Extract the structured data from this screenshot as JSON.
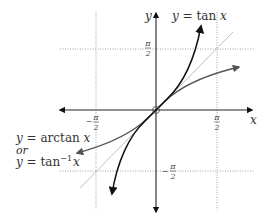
{
  "diagram": {
    "colors": {
      "axis": "#222222",
      "tan_curve": "#111111",
      "arctan_curve": "#555555",
      "identity_line": "#aaaaaa",
      "grid_dotted": "#888888"
    },
    "axes": {
      "x_label": "x",
      "y_label": "y"
    },
    "ticks": {
      "x_neg": {
        "sign": "−",
        "num": "π",
        "den": "2"
      },
      "x_pos": {
        "sign": "",
        "num": "π",
        "den": "2"
      },
      "y_pos": {
        "sign": "",
        "num": "π",
        "den": "2"
      },
      "y_neg": {
        "sign": "−",
        "num": "π",
        "den": "2"
      }
    },
    "labels": {
      "tan": {
        "prefix": "y = ",
        "fn": "tan",
        "var": " x"
      },
      "arctan_line1": {
        "prefix": "y = ",
        "fn": "arctan",
        "var": " x"
      },
      "or": "or",
      "arctan_line2": {
        "prefix": "y = ",
        "fn": "tan",
        "sup": "−1",
        "var": "x"
      }
    },
    "asymptotes": {
      "vertical": [
        "x = −π/2",
        "x = π/2"
      ],
      "horizontal": [
        "y = π/2",
        "y = −π/2"
      ]
    },
    "reference_line": "y = x",
    "origin_marker": "open circle at (0,0)"
  }
}
